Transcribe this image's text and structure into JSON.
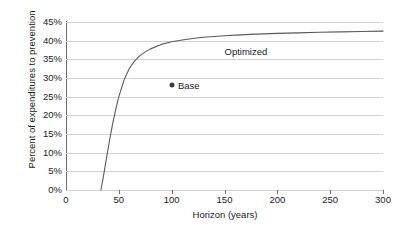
{
  "chart_data": {
    "type": "line",
    "title": "",
    "xlabel": "Horizon (years)",
    "ylabel": "Percent of expenditures to prevention",
    "xlim": [
      0,
      300
    ],
    "ylim": [
      0,
      45
    ],
    "grid": true,
    "legend_position": "inline-annotation",
    "xticks": [
      0,
      50,
      100,
      150,
      200,
      250,
      300
    ],
    "xtick_labels": [
      "0",
      "50",
      "100",
      "150",
      "200",
      "250",
      "300"
    ],
    "yticks": [
      0,
      5,
      10,
      15,
      20,
      25,
      30,
      35,
      40,
      45
    ],
    "ytick_labels": [
      "0%",
      "5%",
      "10%",
      "15%",
      "20%",
      "25%",
      "30%",
      "35%",
      "40%",
      "45%"
    ],
    "series": [
      {
        "name": "Optimized",
        "type": "line",
        "color": "#5a5a5a",
        "label_text": "Optimized",
        "label_x": 150,
        "label_y": 38.2,
        "x": [
          33,
          35,
          38,
          41,
          44,
          47,
          50,
          55,
          60,
          65,
          70,
          75,
          80,
          90,
          100,
          110,
          120,
          130,
          140,
          150,
          165,
          180,
          200,
          220,
          240,
          260,
          280,
          300
        ],
        "y": [
          0,
          3.0,
          8.0,
          13.0,
          17.5,
          21.5,
          25.0,
          29.5,
          32.6,
          34.6,
          36.0,
          37.0,
          37.8,
          39.0,
          39.7,
          40.2,
          40.6,
          40.9,
          41.1,
          41.3,
          41.55,
          41.75,
          41.95,
          42.1,
          42.25,
          42.35,
          42.45,
          42.55
        ]
      },
      {
        "name": "Base",
        "type": "scatter",
        "color": "#3c3c3c",
        "label_text": "Base",
        "label_x": 106,
        "points": [
          {
            "x": 100,
            "y": 28.0
          }
        ]
      }
    ]
  },
  "colors": {
    "curve": "#5a5a5a",
    "marker": "#3c3c3c",
    "gridline": "#d2d2d2",
    "axis": "#6f6f6f",
    "text": "#1b1b1b",
    "background": "#ffffff"
  }
}
